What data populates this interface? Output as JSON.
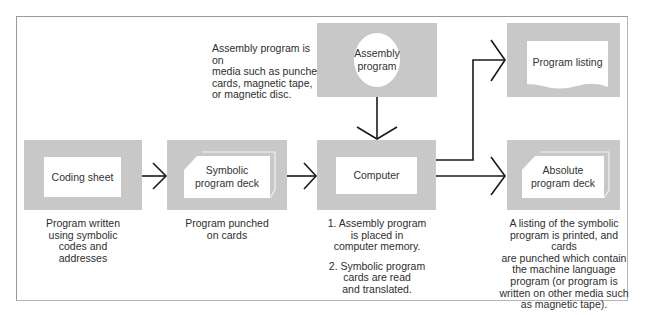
{
  "diagram": {
    "type": "flowchart",
    "nodes": {
      "coding_sheet": {
        "label": "Coding sheet",
        "caption": "Program written\nusing symbolic\ncodes and\naddresses"
      },
      "symbolic_deck": {
        "label": "Symbolic\nprogram deck",
        "caption": "Program punched\non cards"
      },
      "computer": {
        "label": "Computer",
        "caption_1": "1. Assembly program\nis placed in\ncomputer memory.",
        "caption_2": "2. Symbolic program\ncards are read\nand translated."
      },
      "assembly_program": {
        "label": "Assembly\nprogram",
        "caption": "Assembly program is on\nmedia such as punched\ncards, magnetic tape,\nor magnetic disc."
      },
      "program_listing": {
        "label": "Program listing"
      },
      "absolute_deck": {
        "label": "Absolute\nprogram deck",
        "caption": "A listing of the symbolic\nprogram is printed, and cards\nare punched which contain\nthe machine language\nprogram (or program is\nwritten on other media such\nas magnetic tape)."
      }
    },
    "edges": [
      {
        "from": "Coding sheet",
        "to": "Symbolic program deck"
      },
      {
        "from": "Symbolic program deck",
        "to": "Computer"
      },
      {
        "from": "Assembly program",
        "to": "Computer"
      },
      {
        "from": "Computer",
        "to": "Program listing"
      },
      {
        "from": "Computer",
        "to": "Absolute program deck"
      }
    ],
    "colors": {
      "box_fill": "#c8c8c8",
      "inner_fill": "#ffffff",
      "line": "#1a1a1a",
      "frame": "#9a9a9a"
    }
  }
}
